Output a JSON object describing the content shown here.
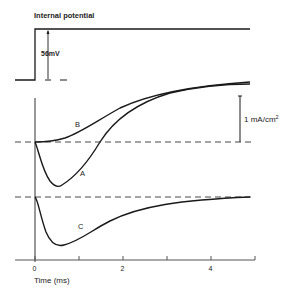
{
  "labels": {
    "top_title": "Internal potential",
    "step_amplitude": "56mV",
    "scale_bar": "1 mA/cm",
    "scale_bar_sup": "2",
    "curve_a": "A",
    "curve_b": "B",
    "curve_c": "C",
    "x_axis": "Time (ms)"
  },
  "x_ticks": [
    {
      "value": 0,
      "label": "0"
    },
    {
      "value": 1,
      "label": ""
    },
    {
      "value": 2,
      "label": "2"
    },
    {
      "value": 3,
      "label": ""
    },
    {
      "value": 4,
      "label": "4"
    },
    {
      "value": 5,
      "label": ""
    }
  ],
  "colors": {
    "line": "#1a1a1a",
    "axis": "#555555",
    "background": "#ffffff"
  }
}
